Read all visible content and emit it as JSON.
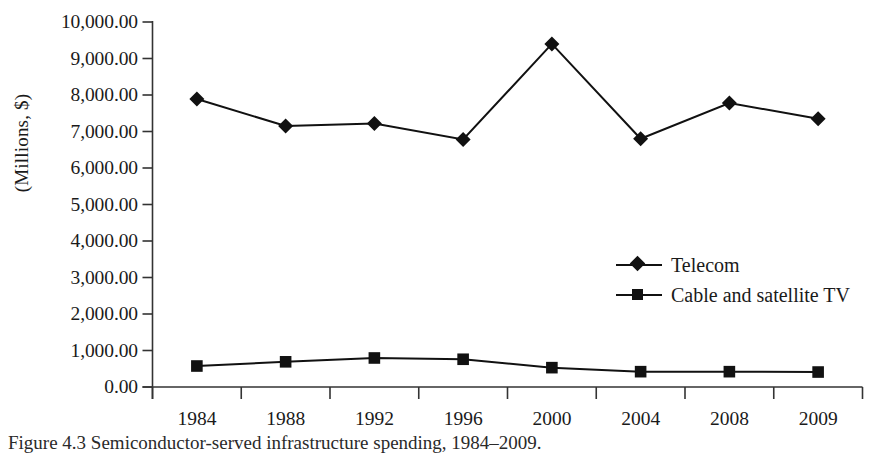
{
  "figure": {
    "caption": "Figure 4.3  Semiconductor-served infrastructure spending, 1984–2009."
  },
  "chart_data": {
    "type": "line",
    "title": "",
    "xlabel": "",
    "ylabel": "(Millions, $)",
    "categories": [
      "1984",
      "1988",
      "1992",
      "1996",
      "2000",
      "2004",
      "2008",
      "2009"
    ],
    "series": [
      {
        "name": "Telecom",
        "marker": "diamond",
        "color": "#111111",
        "values": [
          7890,
          7150,
          7220,
          6780,
          9400,
          6800,
          7780,
          7350
        ]
      },
      {
        "name": "Cable and satellite TV",
        "marker": "square",
        "color": "#111111",
        "values": [
          575,
          690,
          795,
          760,
          530,
          420,
          420,
          410
        ]
      }
    ],
    "ylim": [
      0,
      10000
    ],
    "ytick_values": [
      0,
      1000,
      2000,
      3000,
      4000,
      5000,
      6000,
      7000,
      8000,
      9000,
      10000
    ],
    "ytick_labels": [
      "0.00",
      "1,000.00",
      "2,000.00",
      "3,000.00",
      "4,000.00",
      "5,000.00",
      "6,000.00",
      "7,000.00",
      "8,000.00",
      "9,000.00",
      "10,000.00"
    ],
    "grid": false,
    "legend_position": "center-right",
    "legend_entries": [
      "Telecom",
      "Cable and satellite TV"
    ]
  },
  "axes": {
    "y_axis_label": "(Millions, $)",
    "x_axis_label": ""
  }
}
